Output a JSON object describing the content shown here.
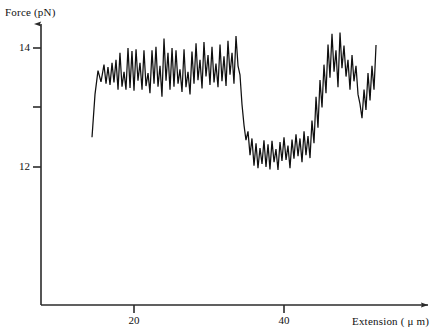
{
  "figure": {
    "background": "#ffffff",
    "line_color": "#101010",
    "axis_color": "#2b2b2b"
  },
  "axes": {
    "y_title": "Force (pN)",
    "x_title": "Extension ( μ m)",
    "y_ticks": [
      {
        "value": 14,
        "label": "14",
        "y_px": 48
      },
      {
        "value": 13,
        "label": "",
        "y_px": 107
      },
      {
        "value": 12,
        "label": "12",
        "y_px": 167
      }
    ],
    "x_ticks": [
      {
        "value": 20,
        "label": "20",
        "x_px": 134
      },
      {
        "value": 40,
        "label": "40",
        "x_px": 284
      }
    ],
    "origin_px": {
      "x": 41,
      "y": 305
    },
    "y_axis_top_px": 22,
    "x_axis_right_px": 432
  },
  "chart_data": {
    "type": "line",
    "title": "",
    "xlabel": "Extension ( μ m)",
    "ylabel": "Force (pN)",
    "xlim": [
      12.8,
      52.5
    ],
    "ylim": [
      11.2,
      14.6
    ],
    "grid": false,
    "legend": null,
    "series": [
      {
        "name": "force-extension trace",
        "color": "#101010",
        "x": [
          14.4,
          14.8,
          15.2,
          15.6,
          16.0,
          16.27,
          16.53,
          16.8,
          17.07,
          17.33,
          17.6,
          17.87,
          18.13,
          18.4,
          18.67,
          18.93,
          19.2,
          19.47,
          19.73,
          20.0,
          20.27,
          20.53,
          20.8,
          21.07,
          21.33,
          21.6,
          21.87,
          22.13,
          22.4,
          22.67,
          22.93,
          23.2,
          23.47,
          23.73,
          24.0,
          24.27,
          24.53,
          24.8,
          25.07,
          25.33,
          25.6,
          25.87,
          26.13,
          26.4,
          26.67,
          26.93,
          27.2,
          27.47,
          27.73,
          28.0,
          28.27,
          28.53,
          28.8,
          29.07,
          29.33,
          29.6,
          29.87,
          30.13,
          30.4,
          30.67,
          30.93,
          31.2,
          31.47,
          31.73,
          32.0,
          32.27,
          32.53,
          32.8,
          33.07,
          33.33,
          33.6,
          33.87,
          34.13,
          34.4,
          34.67,
          34.93,
          35.2,
          35.47,
          35.73,
          36.0,
          36.27,
          36.53,
          36.8,
          37.07,
          37.33,
          37.6,
          37.87,
          38.13,
          38.4,
          38.67,
          38.93,
          39.2,
          39.47,
          39.73,
          40.0,
          40.27,
          40.53,
          40.8,
          41.07,
          41.33,
          41.6,
          41.87,
          42.13,
          42.4,
          42.67,
          42.93,
          43.2,
          43.47,
          43.73,
          44.0,
          44.27,
          44.53,
          44.8,
          45.07,
          45.33,
          45.6,
          45.87,
          46.13,
          46.4,
          46.67,
          46.93,
          47.2,
          47.47,
          47.73,
          48.0,
          48.27,
          48.53,
          48.8,
          49.07,
          49.33,
          49.6,
          49.87,
          50.13,
          50.4,
          50.67,
          50.93,
          51.2,
          51.47,
          51.73,
          52.0,
          52.27
        ],
        "y": [
          12.5,
          13.22,
          13.62,
          13.43,
          13.72,
          13.4,
          13.68,
          13.38,
          13.75,
          13.42,
          13.8,
          13.3,
          13.92,
          13.35,
          13.6,
          13.3,
          14.0,
          13.33,
          13.95,
          13.28,
          13.98,
          13.45,
          13.75,
          13.3,
          13.96,
          13.36,
          13.58,
          13.24,
          13.96,
          13.4,
          14.02,
          13.35,
          13.7,
          13.18,
          14.16,
          13.45,
          13.92,
          13.3,
          14.0,
          13.35,
          13.96,
          13.4,
          13.64,
          13.26,
          13.98,
          13.34,
          13.6,
          13.22,
          13.94,
          13.4,
          14.08,
          13.46,
          13.8,
          13.32,
          14.1,
          13.52,
          13.88,
          13.38,
          14.02,
          13.42,
          13.74,
          13.34,
          14.06,
          13.44,
          13.86,
          13.36,
          14.12,
          13.55,
          13.92,
          13.4,
          14.2,
          13.7,
          13.55,
          13.05,
          12.7,
          12.45,
          12.6,
          12.2,
          12.48,
          12.02,
          12.4,
          11.98,
          12.32,
          12.05,
          12.45,
          12.0,
          12.38,
          11.96,
          12.44,
          12.08,
          12.3,
          11.95,
          12.42,
          12.1,
          12.5,
          12.12,
          12.36,
          11.98,
          12.46,
          12.14,
          12.55,
          12.18,
          12.48,
          12.08,
          12.6,
          12.2,
          12.52,
          12.15,
          12.78,
          12.4,
          13.18,
          12.66,
          13.46,
          13.0,
          13.72,
          13.24,
          14.06,
          13.5,
          14.24,
          13.6,
          13.96,
          13.34,
          14.26,
          13.66,
          14.04,
          13.52,
          13.8,
          13.3,
          13.88,
          13.44,
          13.7,
          13.22,
          13.06,
          12.82,
          13.3,
          12.96,
          13.58,
          13.12,
          13.7,
          13.3,
          14.05
        ]
      }
    ],
    "annotations": [
      {
        "text": "high-force plateau",
        "x_range": [
          15,
          33
        ],
        "y_mean": 13.65
      },
      {
        "text": "low-force plateau",
        "x_range": [
          35,
          44
        ],
        "y_mean": 12.25
      },
      {
        "text": "recovered plateau",
        "x_range": [
          45,
          52
        ],
        "y_mean": 13.6
      }
    ]
  }
}
